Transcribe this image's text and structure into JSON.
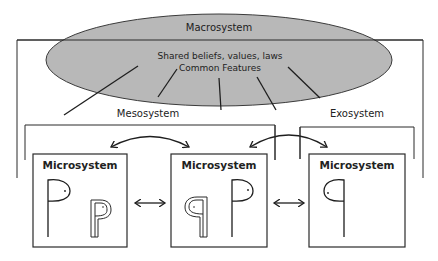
{
  "macrosystem": {
    "label": "Macrosystem",
    "description_line1": "Shared beliefs, values, laws",
    "description_line2": "Common Features",
    "fill_color": "#b8b8b8"
  },
  "mesosystem": {
    "label": "Mesosystem"
  },
  "exosystem": {
    "label": "Exosystem"
  },
  "microsystems": [
    {
      "label": "Microsystem",
      "figures": [
        "large-p-figure",
        "small-outlined-p-figure"
      ]
    },
    {
      "label": "Microsystem",
      "figures": [
        "small-outlined-q-figure",
        "large-p-figure"
      ]
    },
    {
      "label": "Microsystem",
      "figures": [
        "large-q-figure"
      ]
    }
  ],
  "connectors": {
    "between_microsystems": [
      "bidirectional-arrow",
      "bidirectional-arrow"
    ],
    "curved_arrows": [
      "bidirectional-curved-arrow",
      "bidirectional-curved-arrow"
    ],
    "influence_lines": 5
  }
}
